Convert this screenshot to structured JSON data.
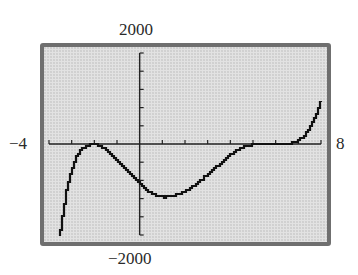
{
  "window": {
    "xmin_label": "−4",
    "xmax_label": "8",
    "ymax_label": "2000",
    "ymin_label": "−2000"
  },
  "colors": {
    "screen_background": "#e2e2e2",
    "frame": "#6f6f6f",
    "curve": "#111111",
    "axes": "#222222",
    "labels": "#2a2a2a"
  },
  "chart_data": {
    "type": "line",
    "title": "",
    "xlabel": "",
    "ylabel": "",
    "xlim": [
      -4,
      8
    ],
    "ylim": [
      -2000,
      2000
    ],
    "x_tick_step": 1,
    "y_tick_step": 400,
    "grid": false,
    "legend": null,
    "annotations": [
      "-4",
      "8",
      "2000",
      "-2000"
    ],
    "series": [
      {
        "name": "f(x)",
        "x": [
          -3.5,
          -3.29,
          -3.02,
          -2.67,
          -2.3,
          -2.0,
          -1.6,
          -1.13,
          -0.6,
          0.0,
          0.5,
          1.07,
          1.7,
          2.4,
          3.0,
          3.72,
          4.2,
          4.6,
          5.0,
          5.48,
          6.0,
          6.58,
          7.0,
          7.37,
          7.7,
          8.0
        ],
        "y": [
          -2000,
          -1231,
          -615,
          -176,
          -40,
          0,
          -90,
          -308,
          -560,
          -857,
          -1070,
          -1165,
          -1100,
          -923,
          -660,
          -352,
          -180,
          -66,
          -20,
          0,
          0,
          0,
          80,
          242,
          550,
          923
        ]
      }
    ]
  }
}
